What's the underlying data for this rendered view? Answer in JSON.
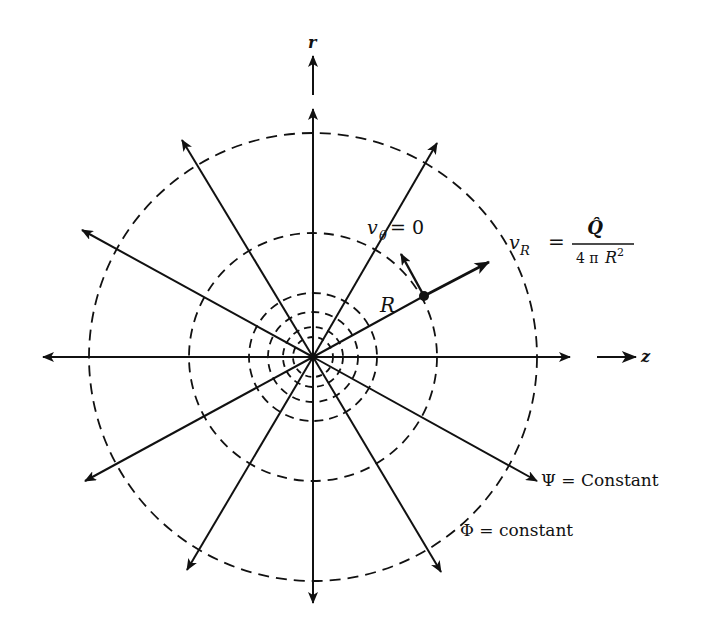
{
  "figure": {
    "type": "flow-field-diagram",
    "colors": {
      "ink": "#111111",
      "background": "#ffffff"
    },
    "center": {
      "x": 313,
      "y": 357
    },
    "axes": {
      "horizontal_label": "z",
      "vertical_label": "r"
    },
    "equipotentials": {
      "style": "dashed",
      "radii": [
        20,
        30,
        45,
        64,
        124,
        224
      ]
    },
    "streamlines": {
      "style": "solid-arrow",
      "count": 12,
      "angles_deg": [
        0,
        30,
        60,
        90,
        120,
        150,
        180,
        210,
        240,
        270,
        300,
        330
      ]
    },
    "labels": {
      "v_theta": {
        "symbol": "v",
        "subscript": "θ",
        "rhs": "= 0"
      },
      "v_R": {
        "symbol": "v",
        "subscript": "R",
        "equals": "=",
        "numerator": "Q̂",
        "denominator_coef": "4 π",
        "denominator_var": "R",
        "denominator_exp": "2"
      },
      "R": "R",
      "psi": "Ψ = Constant",
      "phi": "Φ = constant"
    },
    "point": {
      "x": 424,
      "y": 296
    }
  }
}
